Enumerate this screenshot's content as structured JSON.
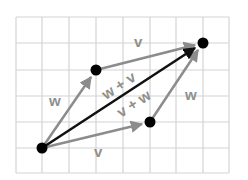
{
  "diagram": {
    "grid": {
      "cols": 8,
      "rows": 6,
      "origin_px": [
        16,
        17
      ],
      "cell_px": 26.6,
      "color": "#d4d4d4"
    },
    "points": {
      "origin": [
        1,
        5
      ],
      "w_tip": [
        3,
        2
      ],
      "v_tip": [
        5,
        4
      ],
      "sum_tip": [
        7,
        1
      ]
    },
    "vectors": [
      {
        "name": "w",
        "from": "origin",
        "to": "w_tip",
        "label": "w",
        "color": "#8c8c8c"
      },
      {
        "name": "v_top",
        "from": "w_tip",
        "to": "sum_tip",
        "label": "v",
        "color": "#8c8c8c"
      },
      {
        "name": "v",
        "from": "origin",
        "to": "v_tip",
        "label": "v",
        "color": "#8c8c8c"
      },
      {
        "name": "w_right",
        "from": "v_tip",
        "to": "sum_tip",
        "label": "w",
        "color": "#8c8c8c"
      },
      {
        "name": "sum",
        "from": "origin",
        "to": "sum_tip",
        "color": "#111111"
      }
    ],
    "labels": {
      "w_left": "w",
      "v_top": "v",
      "v_bottom": "v",
      "w_right": "w",
      "sum_upper": "w + v",
      "sum_lower": "v + w"
    },
    "dot_color": "#000000"
  }
}
